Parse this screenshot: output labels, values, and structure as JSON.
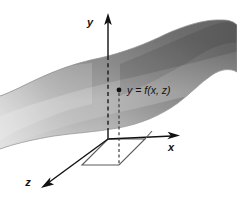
{
  "figure": {
    "kind": "3d-surface-diagram",
    "background_color": "#ffffff",
    "width": 237,
    "height": 202
  },
  "axes": {
    "y": {
      "label": "y",
      "label_x": 90,
      "label_y": 26,
      "direction": "up",
      "arrow_tip_x": 108,
      "arrow_tip_y": 17,
      "base_x": 108,
      "base_y": 139
    },
    "x": {
      "label": "x",
      "label_x": 171,
      "label_y": 151,
      "direction": "right",
      "arrow_tip_x": 178,
      "arrow_tip_y": 136,
      "base_x": 108,
      "base_y": 139
    },
    "z": {
      "label": "z",
      "label_x": 28,
      "label_y": 186,
      "direction": "down-left",
      "arrow_tip_x": 45,
      "arrow_tip_y": 186,
      "base_x": 108,
      "base_y": 139
    }
  },
  "surface": {
    "name": "graph-of-f",
    "fill_light": "#cfcfcf",
    "fill_mid": "#9a9a9a",
    "fill_dark": "#6e6e6e",
    "edge_color": "#8a8a8a",
    "description": "wavy saddle-shaped surface y = f(x, z)"
  },
  "point": {
    "label": "y = f(x, z)",
    "dot_x": 119,
    "dot_y": 90,
    "label_x": 128,
    "label_y": 94,
    "dot_color": "#111111",
    "drop_line_to_y": 139
  },
  "base_projection": {
    "name": "xz-rectangle",
    "line_color": "#5a5a5a",
    "corners": [
      {
        "x": 108,
        "y": 139
      },
      {
        "x": 145,
        "y": 139
      },
      {
        "x": 119,
        "y": 165
      },
      {
        "x": 82,
        "y": 165
      }
    ]
  },
  "colors": {
    "ink": "#111111",
    "base_line": "#5a5a5a",
    "paper": "#ffffff"
  }
}
